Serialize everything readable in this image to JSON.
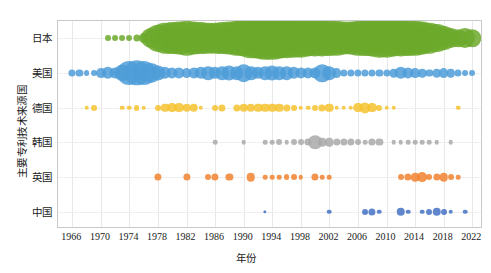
{
  "chart_data": {
    "type": "scatter",
    "title": "",
    "xlabel": "年份",
    "ylabel": "主要专利技术来源国",
    "xlim": [
      1964,
      2023.5
    ],
    "grid": true,
    "legend": "none",
    "categories": [
      "日本",
      "美国",
      "德国",
      "韩国",
      "英国",
      "中国"
    ],
    "xticks": [
      1966,
      1970,
      1974,
      1978,
      1982,
      1986,
      1990,
      1994,
      1998,
      2002,
      2006,
      2010,
      2014,
      2018,
      2022
    ],
    "series": [
      {
        "name": "日本",
        "color": "#6CA92C",
        "points": [
          [
            1971,
            3
          ],
          [
            1972,
            3
          ],
          [
            1973,
            3
          ],
          [
            1974,
            3
          ],
          [
            1975,
            4
          ],
          [
            1976,
            6
          ],
          [
            1977,
            14
          ],
          [
            1978,
            19
          ],
          [
            1979,
            22
          ],
          [
            1980,
            23
          ],
          [
            1981,
            24
          ],
          [
            1982,
            25
          ],
          [
            1983,
            24
          ],
          [
            1984,
            23
          ],
          [
            1985,
            22
          ],
          [
            1986,
            22
          ],
          [
            1987,
            23
          ],
          [
            1988,
            24
          ],
          [
            1989,
            25
          ],
          [
            1990,
            27
          ],
          [
            1991,
            29
          ],
          [
            1992,
            30
          ],
          [
            1993,
            31
          ],
          [
            1994,
            31
          ],
          [
            1995,
            30
          ],
          [
            1996,
            29
          ],
          [
            1997,
            28
          ],
          [
            1998,
            28
          ],
          [
            1999,
            27
          ],
          [
            2000,
            27
          ],
          [
            2001,
            27
          ],
          [
            2002,
            26
          ],
          [
            2003,
            25
          ],
          [
            2004,
            24
          ],
          [
            2005,
            24
          ],
          [
            2006,
            25
          ],
          [
            2007,
            26
          ],
          [
            2008,
            27
          ],
          [
            2009,
            28
          ],
          [
            2010,
            28
          ],
          [
            2011,
            27
          ],
          [
            2012,
            27
          ],
          [
            2013,
            26
          ],
          [
            2014,
            25
          ],
          [
            2015,
            24
          ],
          [
            2016,
            22
          ],
          [
            2017,
            20
          ],
          [
            2018,
            17
          ],
          [
            2019,
            14
          ],
          [
            2020,
            12
          ],
          [
            2021,
            14
          ],
          [
            2022,
            12
          ]
        ]
      },
      {
        "name": "美国",
        "color": "#4E9CD8",
        "points": [
          [
            1966,
            4
          ],
          [
            1967,
            4
          ],
          [
            1968,
            3
          ],
          [
            1969,
            3
          ],
          [
            1970,
            6
          ],
          [
            1971,
            8
          ],
          [
            1972,
            7
          ],
          [
            1973,
            11
          ],
          [
            1974,
            17
          ],
          [
            1975,
            18
          ],
          [
            1976,
            17
          ],
          [
            1977,
            14
          ],
          [
            1978,
            10
          ],
          [
            1979,
            8
          ],
          [
            1980,
            7
          ],
          [
            1981,
            7
          ],
          [
            1982,
            6
          ],
          [
            1983,
            7
          ],
          [
            1984,
            8
          ],
          [
            1985,
            9
          ],
          [
            1986,
            8
          ],
          [
            1987,
            9
          ],
          [
            1988,
            10
          ],
          [
            1989,
            9
          ],
          [
            1990,
            12
          ],
          [
            1991,
            9
          ],
          [
            1992,
            8
          ],
          [
            1993,
            9
          ],
          [
            1994,
            10
          ],
          [
            1995,
            9
          ],
          [
            1996,
            9
          ],
          [
            1997,
            8
          ],
          [
            1998,
            7
          ],
          [
            1999,
            7
          ],
          [
            2000,
            7
          ],
          [
            2001,
            12
          ],
          [
            2002,
            9
          ],
          [
            2003,
            6
          ],
          [
            2004,
            4
          ],
          [
            2005,
            4
          ],
          [
            2006,
            4
          ],
          [
            2007,
            4
          ],
          [
            2008,
            4
          ],
          [
            2009,
            4
          ],
          [
            2010,
            4
          ],
          [
            2011,
            5
          ],
          [
            2012,
            8
          ],
          [
            2013,
            7
          ],
          [
            2014,
            6
          ],
          [
            2015,
            5
          ],
          [
            2016,
            4
          ],
          [
            2017,
            5
          ],
          [
            2018,
            6
          ],
          [
            2019,
            5
          ],
          [
            2020,
            4
          ],
          [
            2021,
            3
          ],
          [
            2022,
            3
          ]
        ]
      },
      {
        "name": "德国",
        "color": "#F6C22E",
        "points": [
          [
            1968,
            2
          ],
          [
            1969,
            3
          ],
          [
            1973,
            2
          ],
          [
            1974,
            2
          ],
          [
            1975,
            3
          ],
          [
            1976,
            2
          ],
          [
            1978,
            3
          ],
          [
            1979,
            5
          ],
          [
            1980,
            6
          ],
          [
            1981,
            6
          ],
          [
            1982,
            5
          ],
          [
            1983,
            5
          ],
          [
            1984,
            2
          ],
          [
            1986,
            3
          ],
          [
            1987,
            4
          ],
          [
            1989,
            4
          ],
          [
            1990,
            5
          ],
          [
            1991,
            5
          ],
          [
            1992,
            5
          ],
          [
            1993,
            5
          ],
          [
            1994,
            5
          ],
          [
            1995,
            5
          ],
          [
            1996,
            4
          ],
          [
            1997,
            3
          ],
          [
            1998,
            2
          ],
          [
            1999,
            2
          ],
          [
            2000,
            3
          ],
          [
            2001,
            4
          ],
          [
            2002,
            5
          ],
          [
            2003,
            2
          ],
          [
            2004,
            2
          ],
          [
            2005,
            2
          ],
          [
            2006,
            6
          ],
          [
            2007,
            7
          ],
          [
            2008,
            6
          ],
          [
            2009,
            3
          ],
          [
            2010,
            2
          ],
          [
            2011,
            2
          ],
          [
            2020,
            2
          ]
        ]
      },
      {
        "name": "韩国",
        "color": "#A9A9A9",
        "points": [
          [
            1986,
            2
          ],
          [
            1990,
            2
          ],
          [
            1993,
            2
          ],
          [
            1994,
            2
          ],
          [
            1995,
            3
          ],
          [
            1996,
            2
          ],
          [
            1997,
            3
          ],
          [
            1998,
            3
          ],
          [
            1999,
            4
          ],
          [
            2000,
            9
          ],
          [
            2001,
            5
          ],
          [
            2002,
            5
          ],
          [
            2003,
            4
          ],
          [
            2004,
            4
          ],
          [
            2005,
            4
          ],
          [
            2006,
            3
          ],
          [
            2007,
            2
          ],
          [
            2008,
            4
          ],
          [
            2009,
            4
          ],
          [
            2011,
            2
          ],
          [
            2012,
            2
          ],
          [
            2013,
            2
          ],
          [
            2014,
            2
          ],
          [
            2015,
            2
          ],
          [
            2016,
            2
          ],
          [
            2017,
            2
          ],
          [
            2019,
            2
          ]
        ]
      },
      {
        "name": "英国",
        "color": "#F28230",
        "points": [
          [
            1978,
            4
          ],
          [
            1982,
            4
          ],
          [
            1985,
            3
          ],
          [
            1986,
            4
          ],
          [
            1988,
            4
          ],
          [
            1991,
            5
          ],
          [
            1993,
            2
          ],
          [
            1994,
            2
          ],
          [
            1995,
            2
          ],
          [
            1996,
            3
          ],
          [
            1997,
            3
          ],
          [
            1998,
            2
          ],
          [
            2000,
            4
          ],
          [
            2001,
            2
          ],
          [
            2002,
            2
          ],
          [
            2012,
            3
          ],
          [
            2013,
            4
          ],
          [
            2014,
            5
          ],
          [
            2015,
            6
          ],
          [
            2016,
            3
          ],
          [
            2017,
            4
          ],
          [
            2018,
            5
          ],
          [
            2019,
            3
          ],
          [
            2020,
            2
          ]
        ]
      },
      {
        "name": "中国",
        "color": "#4472C4",
        "points": [
          [
            1993,
            1
          ],
          [
            2002,
            2
          ],
          [
            2007,
            3
          ],
          [
            2008,
            4
          ],
          [
            2009,
            2
          ],
          [
            2012,
            5
          ],
          [
            2013,
            2
          ],
          [
            2015,
            2
          ],
          [
            2016,
            3
          ],
          [
            2017,
            5
          ],
          [
            2018,
            3
          ],
          [
            2019,
            2
          ],
          [
            2021,
            2
          ]
        ]
      }
    ]
  },
  "axes": {
    "y_title": "主要专利技术来源国",
    "x_title": "年份",
    "y_categories": [
      "日本",
      "美国",
      "德国",
      "韩国",
      "英国",
      "中国"
    ],
    "x_ticks": [
      "1966",
      "1970",
      "1974",
      "1978",
      "1982",
      "1986",
      "1990",
      "1994",
      "1998",
      "2002",
      "2006",
      "2010",
      "2014",
      "2018",
      "2022"
    ]
  }
}
